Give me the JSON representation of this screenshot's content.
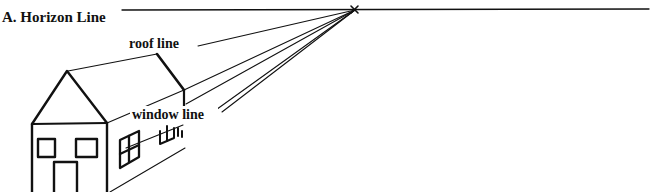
{
  "diagram": {
    "title": "A. Horizon Line",
    "labels": {
      "horizon": "A. Horizon Line",
      "roof": "roof line",
      "window": "window line"
    },
    "vanishing_point_marker": "x",
    "colors": {
      "ink": "#111111",
      "background": "#ffffff"
    },
    "elements": [
      "horizon-line",
      "vanishing-point",
      "house-front-gable",
      "house-front-wall",
      "front-windows",
      "front-door",
      "side-wall",
      "side-windows",
      "perspective-lines"
    ]
  }
}
